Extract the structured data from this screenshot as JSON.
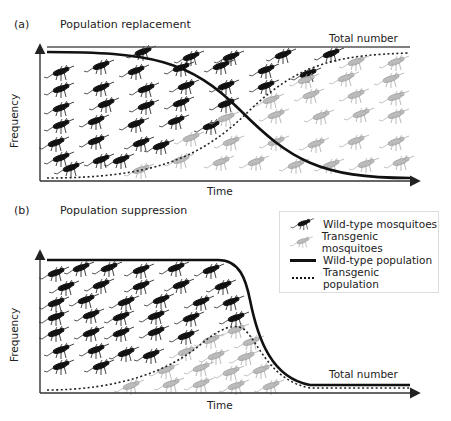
{
  "panel_a": {
    "letter": "(a)",
    "title": "Population replacement",
    "total_label": "Total number",
    "xlabel": "Time",
    "ylabel": "Frequency"
  },
  "panel_b": {
    "letter": "(b)",
    "title": "Population suppression",
    "total_label": "Total number",
    "xlabel": "Time",
    "ylabel": "Frequency"
  },
  "legend": {
    "items": [
      {
        "label": "Wild-type mosquitoes",
        "kind": "mosquito-icon",
        "color": "#111111"
      },
      {
        "label": "Transgenic mosquitoes",
        "kind": "mosquito-icon",
        "color": "#aaaaaa"
      },
      {
        "label": "Wild-type population",
        "kind": "solid-line",
        "color": "#111111"
      },
      {
        "label": "Transgenic population",
        "kind": "dotted-line",
        "color": "#111111"
      }
    ]
  },
  "colors": {
    "wild": "#111111",
    "transgenic": "#a8a8a8",
    "axis": "#333333"
  }
}
